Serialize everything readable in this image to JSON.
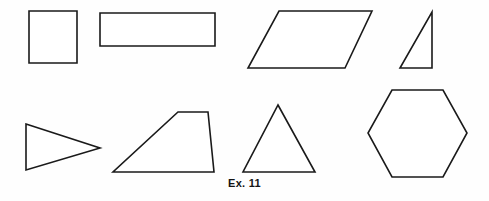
{
  "figure": {
    "caption": "Ex. 11",
    "background_color": "#fefefe",
    "stroke_color": "#1a1a1a",
    "fill_color": "#ffffff",
    "width": 489,
    "height": 201
  },
  "shapes": [
    {
      "id": "square",
      "name": "square",
      "row": 1,
      "points": "29,11 77,11 77,63 29,63",
      "sides": 4
    },
    {
      "id": "rectangle",
      "name": "rectangle",
      "row": 1,
      "points": "100,13 215,13 215,46 100,46",
      "sides": 4
    },
    {
      "id": "parallelogram",
      "name": "parallelogram",
      "row": 1,
      "points": "279,11 372,11 345,68 248,68",
      "sides": 4
    },
    {
      "id": "right-triangle",
      "name": "right triangle",
      "row": 1,
      "points": "432,12 432,68 400,68",
      "sides": 3
    },
    {
      "id": "isosceles-triangle-pointing-right",
      "name": "triangle pointing right",
      "row": 2,
      "points": "26,124 100,148 26,170",
      "sides": 3
    },
    {
      "id": "trapezoid",
      "name": "trapezoid",
      "row": 2,
      "points": "178,112 208,112 214,172 113,172",
      "sides": 4
    },
    {
      "id": "equilateral-triangle",
      "name": "equilateral triangle",
      "row": 2,
      "points": "278,105 315,172 243,172",
      "sides": 3
    },
    {
      "id": "hexagon",
      "name": "hexagon",
      "row": 2,
      "points": "392,90 443,90 467,133 443,177 392,177 368,133",
      "sides": 6
    }
  ]
}
